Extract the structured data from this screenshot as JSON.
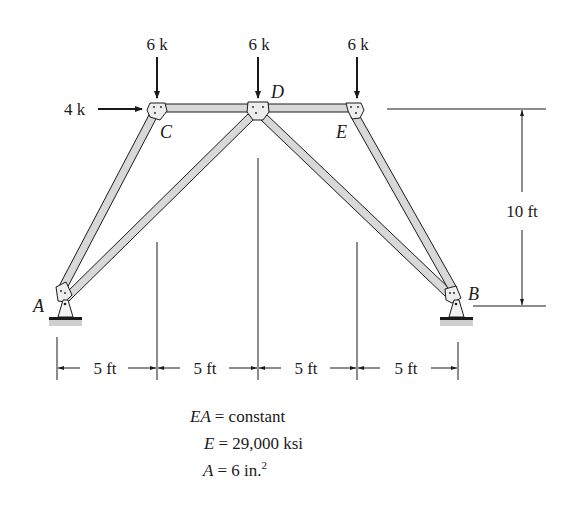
{
  "loads": {
    "vertical_c": "6 k",
    "vertical_d": "6 k",
    "vertical_e": "6 k",
    "horizontal_c": "4 k"
  },
  "joints": {
    "a": "A",
    "b": "B",
    "c": "C",
    "d": "D",
    "e": "E"
  },
  "dimensions": {
    "height": "10 ft",
    "span_1": "5 ft",
    "span_2": "5 ft",
    "span_3": "5 ft",
    "span_4": "5 ft"
  },
  "properties": {
    "ea_lhs": "EA",
    "ea_rhs": "= constant",
    "e_lhs": "E",
    "e_rhs": "= 29,000 ksi",
    "a_lhs": "A",
    "a_rhs": "= 6 in.",
    "a_exp": "2"
  },
  "colors": {
    "member_fill": "#d8d8d8",
    "line": "#1a1a1a"
  }
}
